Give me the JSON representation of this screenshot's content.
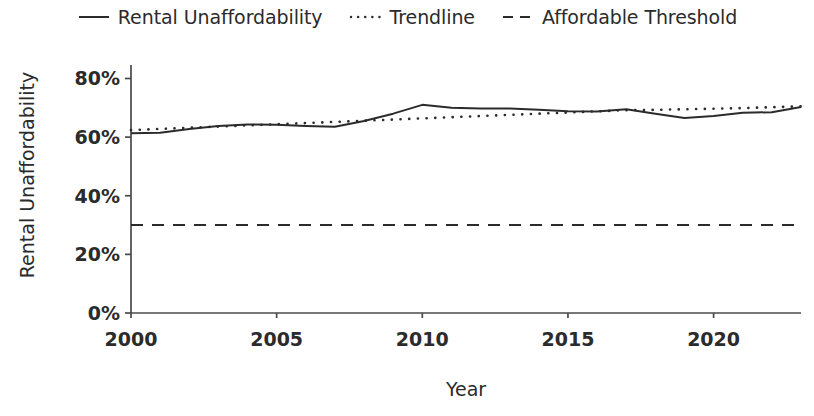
{
  "chart_data": {
    "type": "line",
    "title": "",
    "xlabel": "Year",
    "ylabel": "Rental Unaffordability",
    "xlim": [
      2000,
      2023
    ],
    "ylim": [
      0,
      85
    ],
    "grid": false,
    "legend_position": "top-center",
    "x": [
      2000,
      2001,
      2002,
      2003,
      2004,
      2005,
      2006,
      2007,
      2008,
      2009,
      2010,
      2011,
      2012,
      2013,
      2014,
      2015,
      2016,
      2017,
      2018,
      2019,
      2020,
      2021,
      2022,
      2023
    ],
    "series": [
      {
        "name": "Rental Unaffordability",
        "style": "solid",
        "color": "#2b2b2b",
        "values": [
          61.3,
          61.5,
          62.8,
          63.8,
          64.3,
          64.2,
          63.8,
          63.5,
          65.5,
          68.0,
          71.0,
          70.0,
          69.8,
          69.8,
          69.3,
          68.8,
          68.7,
          69.5,
          68.0,
          66.5,
          67.2,
          68.3,
          68.5,
          70.3
        ]
      },
      {
        "name": "Trendline",
        "style": "dotted",
        "color": "#2b2b2b",
        "values": [
          62.4,
          62.8,
          63.2,
          63.6,
          64.0,
          64.4,
          64.8,
          65.2,
          65.6,
          66.0,
          66.4,
          66.8,
          67.2,
          67.6,
          68.0,
          68.4,
          68.8,
          69.2,
          69.3,
          69.5,
          69.7,
          69.9,
          70.2,
          70.5
        ]
      },
      {
        "name": "Affordable Threshold",
        "style": "dashed",
        "color": "#2b2b2b",
        "constant_value": 30,
        "values": [
          30,
          30,
          30,
          30,
          30,
          30,
          30,
          30,
          30,
          30,
          30,
          30,
          30,
          30,
          30,
          30,
          30,
          30,
          30,
          30,
          30,
          30,
          30,
          30
        ]
      }
    ],
    "yticks": [
      0,
      20,
      40,
      60,
      80
    ],
    "ytick_labels": [
      "0%",
      "20%",
      "40%",
      "60%",
      "80%"
    ],
    "xticks": [
      2000,
      2005,
      2010,
      2015,
      2020
    ],
    "xtick_labels": [
      "2000",
      "2005",
      "2010",
      "2015",
      "2020"
    ]
  },
  "legend": {
    "items": [
      {
        "label": "Rental Unaffordability",
        "key": "solid-line-key"
      },
      {
        "label": "Trendline",
        "key": "dotted-line-key"
      },
      {
        "label": "Affordable Threshold",
        "key": "dashed-line-key"
      }
    ]
  }
}
